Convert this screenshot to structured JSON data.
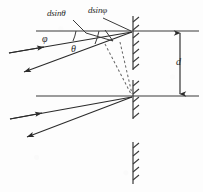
{
  "figure": {
    "labels": {
      "path_difference_theta": "dsinθ",
      "path_difference_phi": "dsinφ",
      "angle_phi": "φ",
      "angle_theta": "θ",
      "spacing": "d"
    },
    "colors": {
      "ink": "#2b2b2b",
      "line": "#3a3a3a",
      "dashed": "#6a6a6a",
      "background": "#fdfdfd"
    },
    "geometry": {
      "plane_top_y": 31,
      "plane_bottom_y": 96,
      "grating_x": 133,
      "spacing_arrow_x": 180,
      "top_scatter_point": [
        133,
        31
      ],
      "bottom_scatter_point": [
        133,
        96
      ]
    },
    "elements": {
      "plane_top": "upper lattice plane",
      "plane_bottom": "lower lattice plane",
      "grating_top": "hatched grating line at upper plane",
      "grating_bottom": "hatched grating line at lower plane",
      "grating_detached": "hatched grating line below figure",
      "incident_ray_top": "incident ray striking upper plane",
      "scattered_ray_top": "scattered ray leaving upper plane",
      "incident_ray_bottom": "incident ray striking lower plane",
      "scattered_ray_bottom": "scattered ray leaving lower plane",
      "dashed_perp_incident": "dashed construction line for incident path difference",
      "dashed_perp_scattered": "dashed construction line for scattered path difference",
      "arc_phi": "angle arc for phi",
      "arc_theta": "angle arc for theta",
      "spacing_arrow": "double headed arrow marking spacing d",
      "leader_theta": "leader line from dsin-theta label",
      "leader_phi": "leader line from dsin-phi label"
    }
  }
}
